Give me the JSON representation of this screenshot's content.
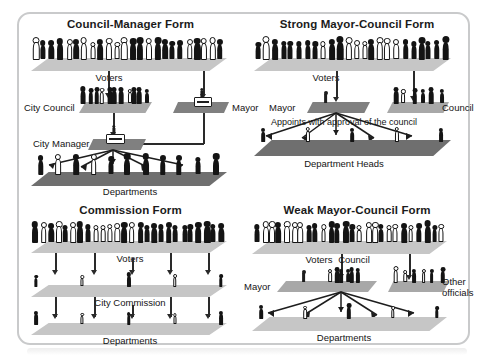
{
  "figure": {
    "panel_border_color": "#c9cacb",
    "background_color": "#ffffff",
    "ink_color": "#1d1d1d"
  },
  "quadrants": [
    {
      "id": "council-manager",
      "title": "Council-Manager Form",
      "labels": {
        "voters": "Voters",
        "city_council": "City Council",
        "mayor": "Mayor",
        "city_manager": "City Manager",
        "departments": "Departments"
      }
    },
    {
      "id": "strong-mayor-council",
      "title": "Strong Mayor-Council Form",
      "labels": {
        "voters": "Voters",
        "mayor": "Mayor",
        "council": "Council",
        "appoints": "Appoints with approval of the council",
        "department_heads": "Department Heads"
      }
    },
    {
      "id": "commission",
      "title": "Commission Form",
      "labels": {
        "voters": "Voters",
        "city_commission": "City Commission",
        "departments": "Departments"
      }
    },
    {
      "id": "weak-mayor-council",
      "title": "Weak Mayor-Council Form",
      "labels": {
        "voters": "Voters",
        "mayor": "Mayor",
        "council": "Council",
        "other_officials_line1": "Other",
        "other_officials_line2": "officials",
        "departments": "Departments"
      }
    }
  ]
}
